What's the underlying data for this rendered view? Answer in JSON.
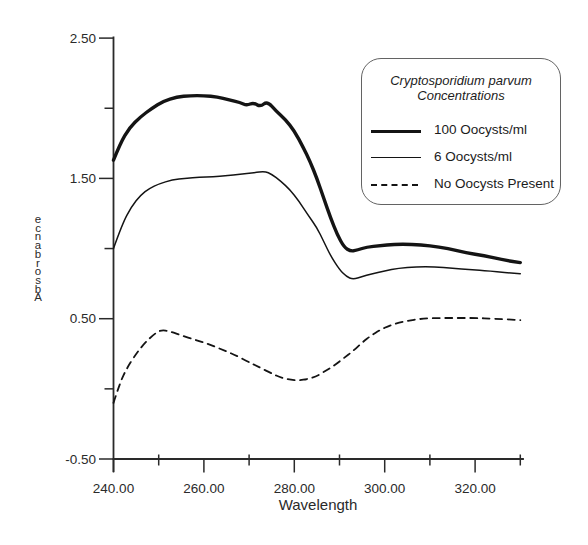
{
  "figure": {
    "background": "#ffffff",
    "line_color": "#141414",
    "axis_color": "#2a2a2a",
    "text_color": "#2a2a2a"
  },
  "legend": {
    "title_line1": "Cryptosporidium parvum",
    "title_line2": "Concentrations",
    "entries": [
      {
        "label": "100 Oocysts/ml",
        "style": "thick-solid"
      },
      {
        "label": "6 Oocysts/ml",
        "style": "thin-solid"
      },
      {
        "label": "No Oocysts Present",
        "style": "dashed"
      }
    ]
  },
  "chart_data": {
    "type": "line",
    "title": "Cryptosporidium parvum Concentrations",
    "xlabel": "Wavelength",
    "ylabel": "Absorbance",
    "xlim": [
      240,
      330.5
    ],
    "ylim": [
      -0.5,
      2.5
    ],
    "grid": false,
    "legend_position": "upper right",
    "x_ticks_major": {
      "values": [
        240,
        260,
        280,
        300,
        320
      ],
      "labels": [
        "240.00",
        "260.00",
        "280.00",
        "300.00",
        "320.00"
      ]
    },
    "x_ticks_minor": [
      250,
      270,
      290,
      310,
      330
    ],
    "y_ticks_major": {
      "values": [
        -0.5,
        0.5,
        1.5,
        2.5
      ],
      "labels": [
        "-0.50",
        "0.50",
        "1.50",
        "2.50"
      ]
    },
    "y_ticks_minor": [
      0,
      1,
      2
    ],
    "series": [
      {
        "name": "100 Oocysts/ml",
        "style": "thick-solid",
        "stroke_width": 3.4,
        "points": [
          [
            240,
            1.63
          ],
          [
            241.5,
            1.75
          ],
          [
            243.5,
            1.86
          ],
          [
            246,
            1.94
          ],
          [
            248.5,
            2.0
          ],
          [
            251,
            2.05
          ],
          [
            254,
            2.08
          ],
          [
            257,
            2.09
          ],
          [
            260,
            2.09
          ],
          [
            263,
            2.08
          ],
          [
            265.5,
            2.06
          ],
          [
            268,
            2.04
          ],
          [
            269.5,
            2.02
          ],
          [
            271,
            2.04
          ],
          [
            272.5,
            2.01
          ],
          [
            274,
            2.05
          ],
          [
            276,
            1.98
          ],
          [
            278,
            1.92
          ],
          [
            280,
            1.84
          ],
          [
            282,
            1.72
          ],
          [
            283.5,
            1.62
          ],
          [
            285,
            1.5
          ],
          [
            286.5,
            1.36
          ],
          [
            288,
            1.22
          ],
          [
            289.5,
            1.1
          ],
          [
            291,
            1.01
          ],
          [
            292.5,
            0.98
          ],
          [
            294,
            0.99
          ],
          [
            296,
            1.01
          ],
          [
            299,
            1.02
          ],
          [
            302,
            1.03
          ],
          [
            306,
            1.03
          ],
          [
            310,
            1.02
          ],
          [
            314,
            1.0
          ],
          [
            318,
            0.97
          ],
          [
            322,
            0.95
          ],
          [
            326,
            0.92
          ],
          [
            330,
            0.9
          ]
        ]
      },
      {
        "name": "6 Oocysts/ml",
        "style": "thin-solid",
        "stroke_width": 1.5,
        "points": [
          [
            240,
            1.0
          ],
          [
            242,
            1.18
          ],
          [
            244,
            1.3
          ],
          [
            246,
            1.38
          ],
          [
            248,
            1.43
          ],
          [
            250,
            1.46
          ],
          [
            253,
            1.49
          ],
          [
            256,
            1.5
          ],
          [
            259,
            1.51
          ],
          [
            262,
            1.51
          ],
          [
            265,
            1.52
          ],
          [
            268,
            1.53
          ],
          [
            271,
            1.54
          ],
          [
            273.5,
            1.55
          ],
          [
            275,
            1.53
          ],
          [
            277,
            1.48
          ],
          [
            279,
            1.42
          ],
          [
            281,
            1.34
          ],
          [
            283,
            1.24
          ],
          [
            285,
            1.15
          ],
          [
            286.5,
            1.05
          ],
          [
            288,
            0.95
          ],
          [
            290,
            0.85
          ],
          [
            291.5,
            0.8
          ],
          [
            293,
            0.78
          ],
          [
            295,
            0.8
          ],
          [
            297,
            0.82
          ],
          [
            300,
            0.84
          ],
          [
            303,
            0.86
          ],
          [
            307,
            0.87
          ],
          [
            311,
            0.87
          ],
          [
            315,
            0.86
          ],
          [
            319,
            0.85
          ],
          [
            323,
            0.84
          ],
          [
            330,
            0.82
          ]
        ]
      },
      {
        "name": "No Oocysts Present",
        "style": "dashed",
        "stroke_width": 1.8,
        "dash": [
          7,
          5.5
        ],
        "points": [
          [
            240,
            -0.1
          ],
          [
            241.5,
            0.05
          ],
          [
            243,
            0.15
          ],
          [
            245,
            0.25
          ],
          [
            247,
            0.33
          ],
          [
            249,
            0.39
          ],
          [
            250.5,
            0.42
          ],
          [
            252.5,
            0.41
          ],
          [
            255,
            0.38
          ],
          [
            258,
            0.35
          ],
          [
            261,
            0.32
          ],
          [
            264,
            0.28
          ],
          [
            267,
            0.24
          ],
          [
            270,
            0.19
          ],
          [
            272.5,
            0.15
          ],
          [
            275,
            0.11
          ],
          [
            277,
            0.08
          ],
          [
            279,
            0.065
          ],
          [
            281,
            0.06
          ],
          [
            283,
            0.07
          ],
          [
            285,
            0.09
          ],
          [
            287,
            0.13
          ],
          [
            289,
            0.17
          ],
          [
            291,
            0.22
          ],
          [
            293,
            0.27
          ],
          [
            295,
            0.33
          ],
          [
            297,
            0.38
          ],
          [
            299,
            0.42
          ],
          [
            301,
            0.45
          ],
          [
            303,
            0.47
          ],
          [
            305,
            0.485
          ],
          [
            308,
            0.5
          ],
          [
            312,
            0.505
          ],
          [
            316,
            0.505
          ],
          [
            320,
            0.505
          ],
          [
            324,
            0.5
          ],
          [
            330,
            0.49
          ]
        ]
      }
    ]
  }
}
